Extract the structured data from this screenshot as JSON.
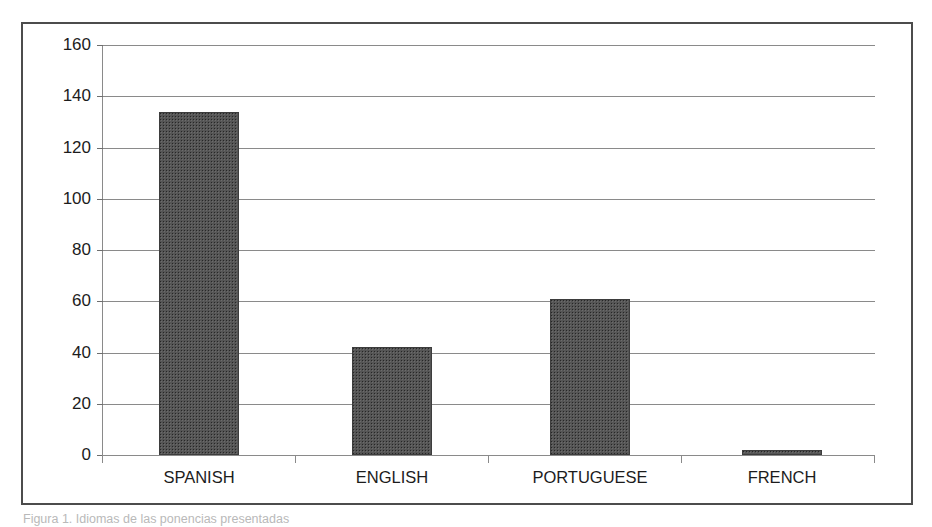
{
  "figure": {
    "caption": "Figura 1. Idiomas de las ponencias presentadas",
    "frame_color": "#4c4c4c",
    "bar_color": "#555555",
    "gridline_color": "#8a8a8a"
  },
  "chart_data": {
    "type": "bar",
    "title": "",
    "xlabel": "",
    "ylabel": "",
    "categories": [
      "SPANISH",
      "ENGLISH",
      "PORTUGUESE",
      "FRENCH"
    ],
    "values": [
      134,
      42,
      61,
      2
    ],
    "ylim": [
      0,
      160
    ],
    "ytick_step": 20,
    "yticks": [
      0,
      20,
      40,
      60,
      80,
      100,
      120,
      140,
      160
    ],
    "ytick_labels": [
      "0",
      "20",
      "40",
      "60",
      "80",
      "100",
      "120",
      "140",
      "160"
    ],
    "grid": true,
    "legend": false,
    "legend_position": "none",
    "series": [
      {
        "name": "Ponencias",
        "values": [
          134,
          42,
          61,
          2
        ]
      }
    ]
  }
}
